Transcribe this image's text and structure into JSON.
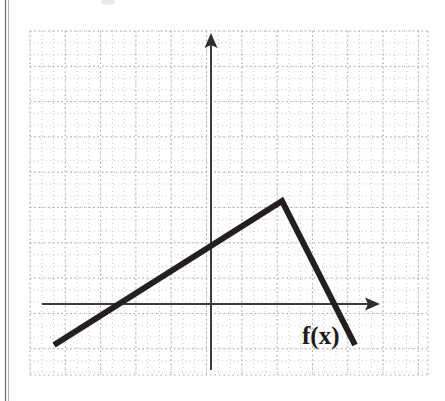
{
  "figure": {
    "label": "f(x)",
    "label_name": "function-label",
    "background_color": "#ffffff",
    "curve_color": "#231f20",
    "axis_color": "#3b3b3b",
    "grid_minor_color": "#c9c9cf",
    "grid_major_color": "#a9a9b4"
  },
  "axes": {
    "x_axis": {
      "name": "x-axis",
      "y_pixel": 304,
      "start_x_pixel": 42,
      "end_x_pixel": 380,
      "arrow": "right-arrow"
    },
    "y_axis": {
      "name": "y-axis",
      "x_pixel": 211,
      "start_y_pixel": 370,
      "end_y_pixel": 33,
      "arrow": "up-arrow"
    },
    "origin_pixel": [
      211,
      304
    ]
  },
  "grid": {
    "left": 30,
    "top": 31,
    "right": 428,
    "bottom": 375,
    "major_spacing_px": 35.3,
    "minor_spacing_px": 11.77,
    "style": "dotted"
  },
  "chart_data": {
    "type": "line",
    "title": "",
    "subtitle": "",
    "xlabel": "",
    "ylabel": "",
    "grid": true,
    "legend": false,
    "annotations": [
      {
        "text": "f(x)",
        "x": 2.5,
        "y": -1.2,
        "pixel_x": 302,
        "pixel_y": 344
      }
    ],
    "axis_style": "arrows-both-ends",
    "xlim": [
      -5.2,
      6.2
    ],
    "ylim": [
      -2.0,
      7.8
    ],
    "x_tick_step": 1,
    "y_tick_step": 1,
    "tick_labels_shown": false,
    "series": [
      {
        "name": "f(x)",
        "kind": "piecewise-linear",
        "color": "#231f20",
        "x": [
          -4.45,
          2.01,
          4.08
        ],
        "y": [
          -1.16,
          2.92,
          -1.16
        ],
        "points_pixel": [
          [
            54,
            345
          ],
          [
            282,
            201
          ],
          [
            355,
            345
          ]
        ],
        "segments": [
          {
            "from": [
              -4.45,
              -1.16
            ],
            "to": [
              2.01,
              2.92
            ],
            "slope": 0.63,
            "description": "increasing linear segment"
          },
          {
            "from": [
              2.01,
              2.92
            ],
            "to": [
              4.08,
              -1.16
            ],
            "slope": -1.97,
            "description": "decreasing linear segment"
          }
        ],
        "x_intercepts": [
          -2.61,
          2.53
        ],
        "maximum": {
          "x": 2.01,
          "y": 2.92
        }
      }
    ]
  }
}
